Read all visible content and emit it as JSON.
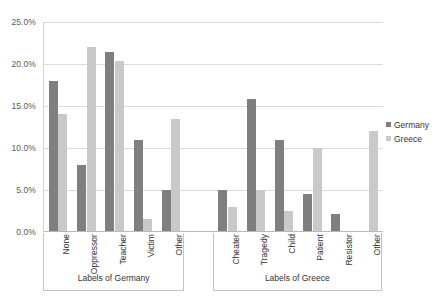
{
  "chart_data": {
    "type": "bar",
    "title": "",
    "xlabel": "",
    "ylabel": "",
    "ylim": [
      0,
      25
    ],
    "ytick_labels": [
      "0.0%",
      "5.0%",
      "10.0%",
      "15.0%",
      "20.0%",
      "25.0%"
    ],
    "ytick_values": [
      0,
      5,
      10,
      15,
      20,
      25
    ],
    "grid": true,
    "legend_position": "right",
    "groups": [
      {
        "name": "Labels of Germany",
        "categories": [
          "None",
          "Oppressor",
          "Teacher",
          "Victim",
          "Other"
        ]
      },
      {
        "name": "Labels of Greece",
        "categories": [
          "Cheater",
          "Tragedy",
          "Child",
          "Patient",
          "Resistor",
          "Other"
        ]
      }
    ],
    "categories": [
      "None",
      "Oppressor",
      "Teacher",
      "Victim",
      "Other",
      "Cheater",
      "Tragedy",
      "Child",
      "Patient",
      "Resistor",
      "Other"
    ],
    "series": [
      {
        "name": "Germany",
        "color": "#7f7f7f",
        "values": [
          18.0,
          8.0,
          21.4,
          11.0,
          5.0,
          5.0,
          15.8,
          11.0,
          4.5,
          2.2,
          0.0
        ]
      },
      {
        "name": "Greece",
        "color": "#c9c9c9",
        "values": [
          14.0,
          22.0,
          20.4,
          1.5,
          13.4,
          3.0,
          5.0,
          2.5,
          10.0,
          0.0,
          12.0
        ]
      }
    ]
  },
  "legend": {
    "entries": [
      {
        "label": "Germany",
        "color": "#7f7f7f"
      },
      {
        "label": "Greece",
        "color": "#c9c9c9"
      }
    ]
  },
  "axis_titles": {
    "germany": "Labels of Germany",
    "greece": "Labels of Greece"
  }
}
